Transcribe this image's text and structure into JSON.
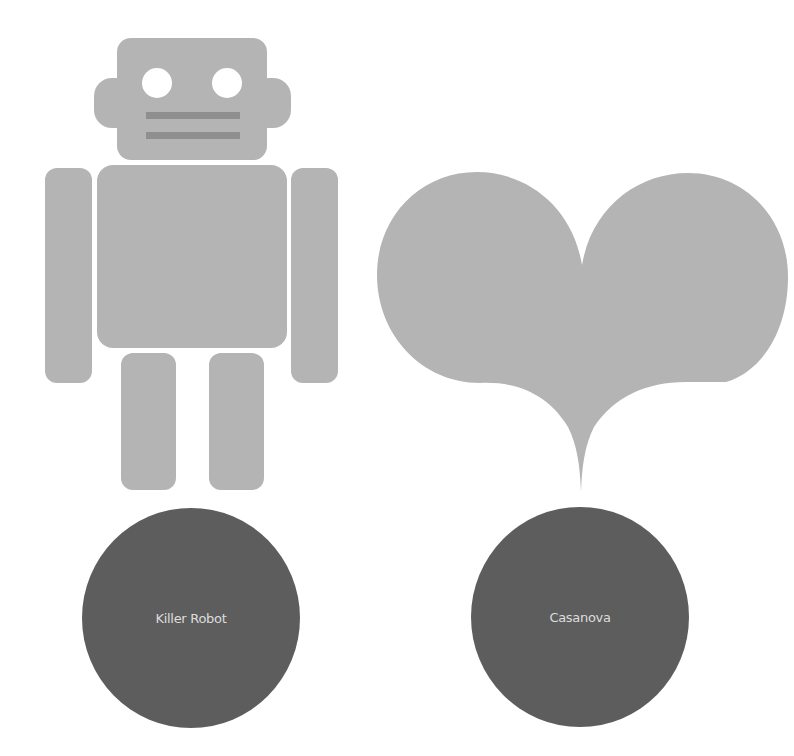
{
  "colors": {
    "background": "#ffffff",
    "figure_fill": "#b4b4b4",
    "mouth_fill": "#8f8f8f",
    "disc_fill": "#5d5d5d",
    "label_text": "#dcdcdc"
  },
  "figures": [
    {
      "id": "robot",
      "icon": "robot-icon",
      "label": "Killer Robot"
    },
    {
      "id": "heart",
      "icon": "heart-icon",
      "label": "Casanova"
    }
  ]
}
